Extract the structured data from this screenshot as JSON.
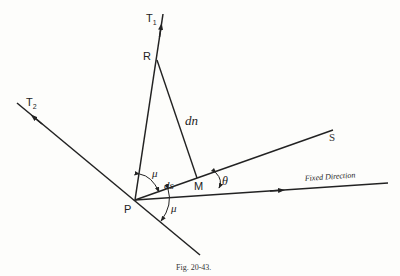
{
  "figure": {
    "caption": "Fig. 20-43.",
    "labels": {
      "t1": "T",
      "t1_sub": "1",
      "t2": "T",
      "t2_sub": "2",
      "r": "R",
      "p": "P",
      "m": "M",
      "s": "S",
      "dn": "dn",
      "ds": "ds",
      "mu_upper": "μ",
      "mu_lower": "μ",
      "theta": "θ",
      "fixed_direction": "Fixed Direction"
    },
    "line_color": "#222222"
  }
}
